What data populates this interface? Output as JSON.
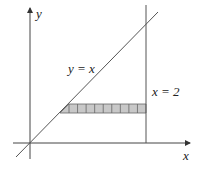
{
  "diagram": {
    "type": "region-of-integration",
    "labels": {
      "y_axis": "y",
      "x_axis": "x",
      "line_diagonal": "y = x",
      "line_vertical": "x = 2"
    },
    "curves": [
      {
        "name": "diagonal",
        "equation": "y = x"
      },
      {
        "name": "vertical",
        "equation": "x = 2"
      }
    ],
    "strip": {
      "orientation": "horizontal",
      "from": "y = x",
      "to": "x = 2",
      "subdivisions": 9
    },
    "colors": {
      "axis": "#444444",
      "line": "#555555",
      "strip_fill": "#c8c8c8",
      "strip_stroke": "#666666"
    }
  }
}
